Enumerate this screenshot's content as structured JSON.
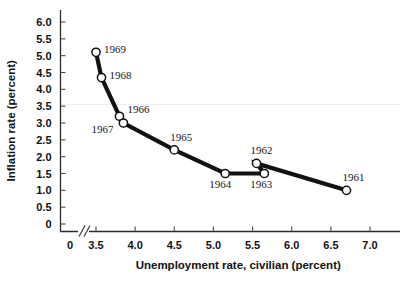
{
  "chart_data": {
    "type": "line",
    "title": "",
    "xlabel": "Unemployment rate, civilian (percent)",
    "ylabel": "Inflation rate (percent)",
    "xlim": [
      3.3,
      7.2
    ],
    "ylim": [
      0,
      6.25
    ],
    "x_ticks": [
      "0",
      "3.5",
      "4.0",
      "4.5",
      "5.0",
      "5.5",
      "6.0",
      "6.5",
      "7.0"
    ],
    "x_tick_values": [
      0,
      3.5,
      4.0,
      4.5,
      5.0,
      5.5,
      6.0,
      6.5,
      7.0
    ],
    "y_ticks": [
      "0",
      "0.5",
      "1.0",
      "1.5",
      "2.0",
      "2.5",
      "3.0",
      "3.5",
      "4.0",
      "4.5",
      "5.0",
      "5.5",
      "6.0"
    ],
    "y_tick_values": [
      0,
      0.5,
      1.0,
      1.5,
      2.0,
      2.5,
      3.0,
      3.5,
      4.0,
      4.5,
      5.0,
      5.5,
      6.0
    ],
    "grid": false,
    "legend": "none",
    "axis_break": "//",
    "marker_style": "open-circle",
    "line_color": "#121212",
    "marker_fill": "#ffffff",
    "points": [
      {
        "label": "1969",
        "x": 3.5,
        "y": 5.1,
        "label_dx": 8,
        "label_dy": 1
      },
      {
        "label": "1968",
        "x": 3.57,
        "y": 4.35,
        "label_dx": 8,
        "label_dy": 1
      },
      {
        "label": "1966",
        "x": 3.8,
        "y": 3.2,
        "label_dx": 8,
        "label_dy": -3
      },
      {
        "label": "1967",
        "x": 3.85,
        "y": 3.0,
        "label_dx": -32,
        "label_dy": 10
      },
      {
        "label": "1965",
        "x": 4.5,
        "y": 2.2,
        "label_dx": -4,
        "label_dy": -9
      },
      {
        "label": "1964",
        "x": 5.15,
        "y": 1.5,
        "label_dx": -16,
        "label_dy": 14
      },
      {
        "label": "1963",
        "x": 5.65,
        "y": 1.5,
        "label_dx": -14,
        "label_dy": 14
      },
      {
        "label": "1962",
        "x": 5.55,
        "y": 1.8,
        "label_dx": -6,
        "label_dy": -9
      },
      {
        "label": "1961",
        "x": 6.7,
        "y": 1.0,
        "label_dx": -4,
        "label_dy": -9
      }
    ],
    "line_order": [
      "1969",
      "1968",
      "1966",
      "1967",
      "1965",
      "1964",
      "1963",
      "1962",
      "1961"
    ]
  }
}
